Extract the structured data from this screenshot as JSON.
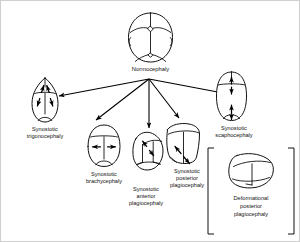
{
  "figure": {
    "name": "cranial-shape-classification-diagram",
    "root": {
      "label": "Normocephaly",
      "shape": "normal-oval-skull-with-patent-sutures"
    },
    "branches": [
      {
        "id": "trigonocephaly",
        "label_lines": [
          "Synostotic",
          "trigonocephaly"
        ],
        "shape": "triangular-pointed-forehead",
        "arrows": "four-diagonal-arrows",
        "suture": "metopic"
      },
      {
        "id": "brachycephaly",
        "label_lines": [
          "Synostotic",
          "brachycephaly"
        ],
        "shape": "wide-short-round-skull",
        "arrows": "horizontal-double-arrow",
        "suture": "bilateral-coronal"
      },
      {
        "id": "anterior-plagiocephaly",
        "label_lines": [
          "Synostotic",
          "anterior",
          "plagiocephaly"
        ],
        "shape": "asymmetric-flattened-front",
        "arrows": "diagonal-double-arrow",
        "suture": "unilateral-coronal"
      },
      {
        "id": "posterior-plagiocephaly",
        "label_lines": [
          "Synostotic",
          "posterior",
          "plagiocephaly"
        ],
        "shape": "trapezoid-flattened-back",
        "arrows": "diagonal-double-arrow",
        "suture": "unilateral-lambdoid"
      },
      {
        "id": "scaphocephaly",
        "label_lines": [
          "Synostotic",
          "scaphocephaly"
        ],
        "shape": "elongated-narrow-skull",
        "arrows": "two-vertical-double-arrows",
        "suture": "sagittal"
      }
    ],
    "bracketed": {
      "id": "deformational-posterior-plagiocephaly",
      "label_lines": [
        "Deformational",
        "posterior",
        "plagiocephaly"
      ],
      "shape": "parallelogram-skull",
      "bracket": "square-brackets-both-sides"
    },
    "colors": {
      "ink": "#111111",
      "background": "#ffffff",
      "border": "#cfcfcf"
    }
  }
}
